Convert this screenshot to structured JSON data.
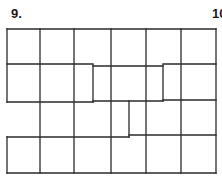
{
  "labels": {
    "puzzle_number": "9.",
    "next_puzzle_number": "10"
  },
  "colors": {
    "line": "#2a2a2a",
    "background": "#ffffff"
  },
  "grid": {
    "columns": 6,
    "rows": 4,
    "description": "6x4 grid of squares divided by thick outlines into irregular regions with staggered horizontal borders"
  }
}
